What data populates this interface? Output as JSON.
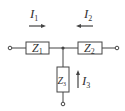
{
  "diagram": {
    "type": "T-network circuit",
    "colors": {
      "line": "#444444",
      "background": "#ffffff"
    },
    "currents": [
      {
        "id": "I1",
        "symbol": "I",
        "subscript": "1",
        "direction": "right"
      },
      {
        "id": "I2",
        "symbol": "I",
        "subscript": "2",
        "direction": "left"
      },
      {
        "id": "I3",
        "symbol": "I",
        "subscript": "3",
        "direction": "up"
      }
    ],
    "impedances": [
      {
        "id": "Z1",
        "symbol": "Z",
        "subscript": "1",
        "position": "left-horizontal"
      },
      {
        "id": "Z2",
        "symbol": "Z",
        "subscript": "2",
        "position": "right-horizontal"
      },
      {
        "id": "Z3",
        "symbol": "Z",
        "subscript": "3",
        "position": "bottom-vertical"
      }
    ],
    "terminals": [
      "left",
      "right",
      "bottom"
    ]
  }
}
